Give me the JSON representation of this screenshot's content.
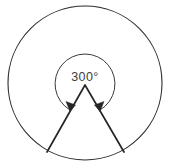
{
  "figure": {
    "type": "geometry-diagram",
    "background_color": "#ffffff",
    "stroke_color": "#262626",
    "label_color": "#3d3d3d",
    "angle_label": "300°",
    "angle_value": 300,
    "angle_unit": "degrees",
    "outer_circle": {
      "name": "outer-circle",
      "center_x": 85,
      "center_y": 83,
      "radius": 77
    },
    "angle_arc": {
      "name": "reflex-angle-arc",
      "center_x": 85,
      "center_y": 85,
      "radius": 30,
      "sweep_degrees": 300,
      "arrowheads": 2,
      "arrowhead_positions": [
        "left-end",
        "right-end"
      ]
    },
    "vertex": {
      "name": "angle-vertex",
      "x": 85,
      "y": 85
    },
    "rays": [
      {
        "name": "left-ray",
        "from_x": 85,
        "from_y": 85,
        "to_x": 47,
        "to_y": 152
      },
      {
        "name": "right-ray",
        "from_x": 85,
        "from_y": 85,
        "to_x": 124,
        "to_y": 152
      }
    ]
  }
}
